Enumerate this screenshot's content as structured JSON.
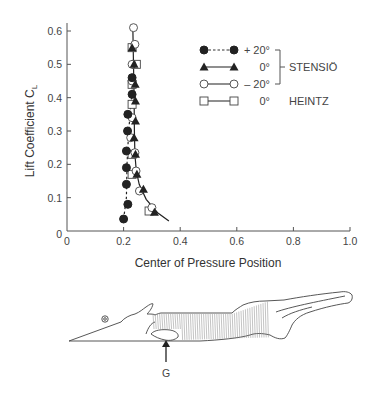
{
  "chart_data": {
    "type": "scatter",
    "title": "",
    "xlabel": "Center of Pressure Position",
    "ylabel": "Lift Coefficient C",
    "ylabel_subscript": "L",
    "xlim": [
      0,
      1.0
    ],
    "ylim": [
      0,
      0.6
    ],
    "xticks": [
      "0",
      "0.2",
      "0.4",
      "0.6",
      "0.8",
      "1.0"
    ],
    "xtick_values": [
      0,
      0.2,
      0.4,
      0.6,
      0.8,
      1.0
    ],
    "yticks": [
      "0",
      "0.1",
      "0.2",
      "0.3",
      "0.4",
      "0.5",
      "0.6"
    ],
    "ytick_values": [
      0,
      0.1,
      0.2,
      0.3,
      0.4,
      0.5,
      0.6
    ],
    "grid": false,
    "legend_position": "top-right",
    "series": [
      {
        "name": "+ 20°",
        "group": "STENSIÖ",
        "marker": "filled-circle",
        "line": "dashed",
        "points": [
          [
            0.2,
            0.036
          ],
          [
            0.215,
            0.08
          ],
          [
            0.21,
            0.14
          ],
          [
            0.21,
            0.19
          ],
          [
            0.21,
            0.24
          ],
          [
            0.214,
            0.3
          ],
          [
            0.215,
            0.35
          ],
          [
            0.23,
            0.41
          ],
          [
            0.23,
            0.46
          ]
        ]
      },
      {
        "name": "0°",
        "group": "STENSIÖ",
        "marker": "filled-triangle",
        "line": "solid",
        "points": [
          [
            0.309,
            0.056
          ],
          [
            0.27,
            0.125
          ],
          [
            0.247,
            0.17
          ],
          [
            0.242,
            0.23
          ],
          [
            0.237,
            0.28
          ],
          [
            0.242,
            0.33
          ],
          [
            0.242,
            0.39
          ],
          [
            0.241,
            0.44
          ],
          [
            0.237,
            0.5
          ],
          [
            0.23,
            0.55
          ]
        ]
      },
      {
        "name": "– 20°",
        "group": "STENSIÖ",
        "marker": "open-circle",
        "line": "solid",
        "points": [
          [
            0.3,
            0.07
          ],
          [
            0.256,
            0.12
          ],
          [
            0.244,
            0.18
          ],
          [
            0.24,
            0.235
          ],
          [
            0.225,
            0.28
          ],
          [
            0.23,
            0.34
          ],
          [
            0.23,
            0.45
          ],
          [
            0.23,
            0.5
          ],
          [
            0.24,
            0.56
          ],
          [
            0.235,
            0.61
          ]
        ]
      },
      {
        "name": "0°",
        "group": "HEINTZ",
        "marker": "open-square",
        "line": "solid",
        "points": [
          [
            0.29,
            0.06
          ],
          [
            0.23,
            0.17
          ],
          [
            0.23,
            0.23
          ],
          [
            0.23,
            0.38
          ],
          [
            0.23,
            0.44
          ],
          [
            0.245,
            0.5
          ],
          [
            0.23,
            0.55
          ]
        ]
      }
    ],
    "curves": {
      "solid_fit": [
        [
          0.36,
          0.03
        ],
        [
          0.32,
          0.055
        ],
        [
          0.28,
          0.095
        ],
        [
          0.255,
          0.14
        ],
        [
          0.245,
          0.18
        ],
        [
          0.24,
          0.23
        ],
        [
          0.238,
          0.3
        ],
        [
          0.237,
          0.4
        ],
        [
          0.235,
          0.5
        ],
        [
          0.233,
          0.6
        ]
      ],
      "dashed_fit": [
        [
          0.2,
          0.036
        ],
        [
          0.21,
          0.1
        ],
        [
          0.212,
          0.2
        ],
        [
          0.218,
          0.3
        ],
        [
          0.228,
          0.4
        ],
        [
          0.232,
          0.46
        ]
      ]
    },
    "legend_groups": [
      {
        "label": "STENSIÖ",
        "series_indices": [
          0,
          1,
          2
        ]
      },
      {
        "label": "HEINTZ",
        "series_indices": [
          3
        ]
      }
    ]
  },
  "figure": {
    "annotation_label": "G"
  }
}
